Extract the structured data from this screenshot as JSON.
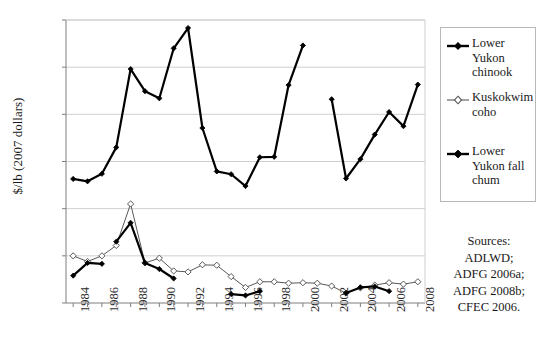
{
  "chart_data": {
    "type": "line",
    "title": "",
    "xlabel": "",
    "ylabel": "$/lb (2007 dollars)",
    "xlim": [
      1983.5,
      2008.5
    ],
    "ylim": [
      0.0,
      6.0
    ],
    "ytick_labels": [
      "$0.00",
      "$1.00",
      "$2.00",
      "$3.00",
      "$4.00",
      "$5.00",
      "$6.00"
    ],
    "ytick_values": [
      0,
      1,
      2,
      3,
      4,
      5,
      6
    ],
    "xtick_labels": [
      "1984",
      "1986",
      "1988",
      "1990",
      "1992",
      "1994",
      "1996",
      "1998",
      "2000",
      "2002",
      "2004",
      "2006",
      "2008"
    ],
    "xtick_values": [
      1984,
      1986,
      1988,
      1990,
      1992,
      1994,
      1996,
      1998,
      2000,
      2002,
      2004,
      2006,
      2008
    ],
    "xtick_minor_values": [
      1985,
      1987,
      1989,
      1991,
      1993,
      1995,
      1997,
      1999,
      2001,
      2003,
      2005,
      2007
    ],
    "grid": "horizontal",
    "legend_position": "right",
    "series": [
      {
        "name": "Lower Yukon chinook",
        "marker": "filled-diamond",
        "color": "#000000",
        "line_width": 2.2,
        "x": [
          1984,
          1985,
          1986,
          1987,
          1988,
          1989,
          1990,
          1991,
          1992,
          1993,
          1994,
          1995,
          1996,
          1997,
          1998,
          1999,
          2000,
          2002,
          2003,
          2004,
          2005,
          2006,
          2007,
          2008
        ],
        "values": [
          2.63,
          2.58,
          2.74,
          3.3,
          4.96,
          4.49,
          4.34,
          5.4,
          5.83,
          3.71,
          2.79,
          2.73,
          2.48,
          3.09,
          3.1,
          4.62,
          5.46,
          4.32,
          2.64,
          3.05,
          3.57,
          4.05,
          3.75,
          4.63
        ]
      },
      {
        "name": "Kuskokwim coho",
        "marker": "open-diamond",
        "color": "#595959",
        "line_width": 1.0,
        "x": [
          1984,
          1985,
          1986,
          1987,
          1988,
          1989,
          1990,
          1991,
          1992,
          1993,
          1994,
          1995,
          1996,
          1997,
          1998,
          1999,
          2000,
          2001,
          2002,
          2003,
          2004,
          2005,
          2006,
          2007,
          2008
        ],
        "values": [
          1.0,
          0.88,
          1.0,
          1.22,
          2.1,
          0.85,
          0.95,
          0.68,
          0.66,
          0.81,
          0.8,
          0.56,
          0.33,
          0.45,
          0.45,
          0.42,
          0.43,
          0.42,
          0.36,
          0.21,
          0.32,
          0.38,
          0.43,
          0.4,
          0.45
        ]
      },
      {
        "name": "Lower Yukon fall chum",
        "marker": "filled-diamond",
        "color": "#000000",
        "line_width": 2.2,
        "segments": [
          {
            "x": [
              1984,
              1985,
              1986
            ],
            "values": [
              0.58,
              0.85,
              0.83
            ]
          },
          {
            "x": [
              1987,
              1988,
              1989,
              1990,
              1991
            ],
            "values": [
              1.3,
              1.7,
              0.85,
              0.72,
              0.52
            ]
          },
          {
            "x": [
              1995,
              1996,
              1997
            ],
            "values": [
              0.19,
              0.16,
              0.25
            ]
          },
          {
            "x": [
              2003,
              2004,
              2005,
              2006
            ],
            "values": [
              0.21,
              0.33,
              0.35,
              0.25
            ]
          }
        ]
      }
    ]
  },
  "legend": {
    "entries": [
      {
        "label": "Lower Yukon chinook",
        "marker": "filled-diamond"
      },
      {
        "label": "Kuskokwim coho",
        "marker": "open-diamond"
      },
      {
        "label": "Lower Yukon fall chum",
        "marker": "filled-diamond"
      }
    ]
  },
  "sources": {
    "lines": [
      "Sources:",
      "ADLWD;",
      "ADFG 2006a;",
      "ADFG 2008b;",
      "CFEC 2006."
    ]
  },
  "colors": {
    "axis": "#7f7f7f",
    "grid": "#cfcfcf",
    "chinook": "#000000",
    "coho": "#595959",
    "chum": "#000000",
    "text": "#1a1a1a"
  }
}
